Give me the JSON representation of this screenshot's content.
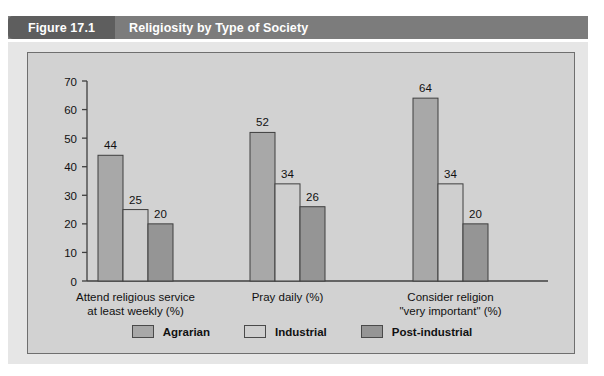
{
  "header": {
    "figure_number": "Figure 17.1",
    "title": "Religiosity by Type of Society",
    "band_color": "#7c7c7c",
    "tab_color": "#5e5e5e",
    "text_color": "#ffffff"
  },
  "panel": {
    "outer_bg": "#e6e6e6",
    "inner_bg": "#d2d2d2",
    "border_color": "#6f6f6f"
  },
  "chart_data": {
    "type": "bar",
    "title": "Religiosity by Type of Society",
    "xlabel": "",
    "ylabel": "",
    "ylim": [
      0,
      70
    ],
    "yticks": [
      0,
      10,
      20,
      30,
      40,
      50,
      60,
      70
    ],
    "ytick_labels": [
      "0",
      "10",
      "20",
      "30",
      "40",
      "50",
      "60",
      "70"
    ],
    "grid": false,
    "legend_position": "bottom",
    "categories": [
      "Attend religious service\nat least weekly (%)",
      "Pray daily (%)",
      "Consider religion\n\"very important\" (%)"
    ],
    "category_lines": [
      [
        "Attend religious service",
        "at least weekly (%)"
      ],
      [
        "Pray daily (%)",
        ""
      ],
      [
        "Consider religion",
        "\"very important\" (%)"
      ]
    ],
    "series": [
      {
        "name": "Agrarian",
        "color": "#a8a8a8",
        "values": [
          44,
          52,
          64
        ],
        "labels": [
          "44",
          "52",
          "64"
        ]
      },
      {
        "name": "Industrial",
        "color": "#cfcfcf",
        "values": [
          25,
          34,
          34
        ],
        "labels": [
          "25",
          "34",
          "34"
        ]
      },
      {
        "name": "Post-industrial",
        "color": "#959595",
        "values": [
          20,
          26,
          20
        ],
        "labels": [
          "20",
          "26",
          "20"
        ]
      }
    ],
    "bar_edge_color": "#3f3f3f",
    "axis_color": "#3f3f3f",
    "tick_label_color": "#111111",
    "value_label_color": "#111111"
  },
  "legend": {
    "items": [
      {
        "label": "Agrarian",
        "color": "#a8a8a8"
      },
      {
        "label": "Industrial",
        "color": "#cfcfcf"
      },
      {
        "label": "Post-industrial",
        "color": "#959595"
      }
    ]
  }
}
